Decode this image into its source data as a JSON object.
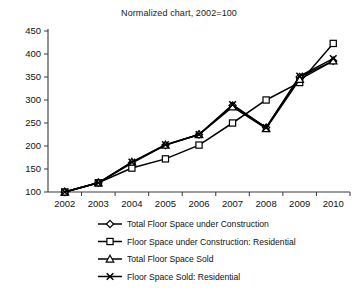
{
  "chart_data": {
    "type": "line",
    "title": "Normalized chart, 2002=100",
    "xlabel": "",
    "ylabel": "",
    "x": [
      2002,
      2003,
      2004,
      2005,
      2006,
      2007,
      2008,
      2009,
      2010
    ],
    "categories": [
      "2002",
      "2003",
      "2004",
      "2005",
      "2006",
      "2007",
      "2008",
      "2009",
      "2010"
    ],
    "ylim": [
      100,
      450
    ],
    "yticks": [
      100,
      150,
      200,
      250,
      300,
      350,
      400,
      450
    ],
    "ytick_labels": [
      "100",
      "150",
      "200",
      "250",
      "300",
      "350",
      "400",
      "450"
    ],
    "grid": false,
    "legend_position": "bottom",
    "series": [
      {
        "name": "Total Floor Space under Construction",
        "marker": "diamond",
        "values": [
          100,
          120,
          163,
          202,
          225,
          288,
          240,
          350,
          385
        ]
      },
      {
        "name": "Floor Space under Construction: Residential",
        "marker": "square",
        "values": [
          100,
          120,
          152,
          172,
          202,
          250,
          300,
          338,
          423
        ]
      },
      {
        "name": "Total Floor Space Sold",
        "marker": "triangle",
        "values": [
          100,
          120,
          165,
          202,
          225,
          285,
          238,
          345,
          385
        ]
      },
      {
        "name": "Floor Space Sold: Residential",
        "marker": "x",
        "values": [
          100,
          120,
          165,
          203,
          225,
          290,
          240,
          352,
          390
        ]
      }
    ]
  },
  "colors": {
    "line": "#000000",
    "axis": "#3a3a3a",
    "text": "#111111",
    "background": "#ffffff"
  }
}
